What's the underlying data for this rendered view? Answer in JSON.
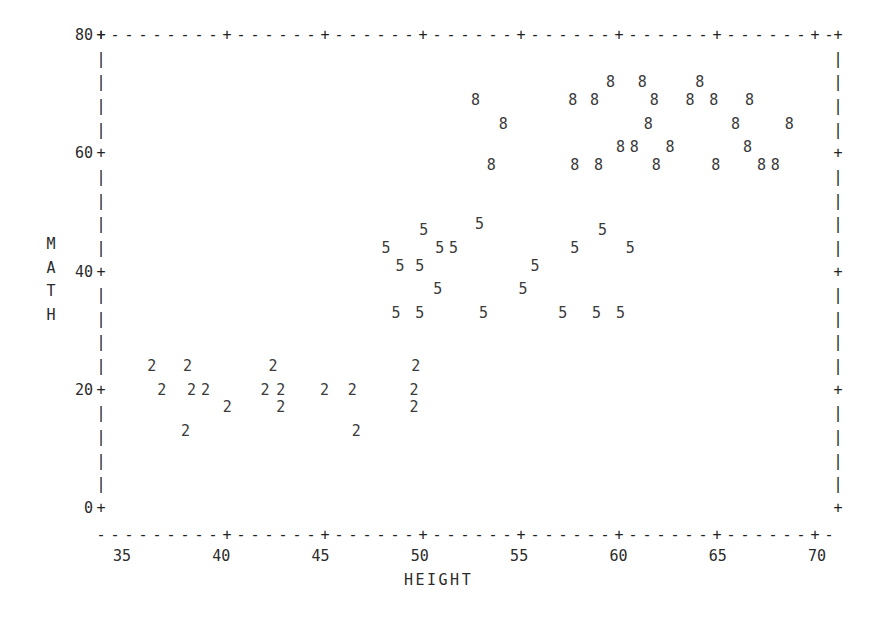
{
  "plot": {
    "type": "text-mode-scatter",
    "xlabel": "HEIGHT",
    "ylabel": "MATH",
    "ylabel_chars": [
      "M",
      "A",
      "T",
      "H"
    ],
    "y_ticks": [
      "80",
      "60",
      "40",
      "20",
      "0"
    ],
    "x_ticks": [
      "35",
      "40",
      "45",
      "50",
      "55",
      "60",
      "65",
      "70"
    ],
    "axis_tick_glyph": "+",
    "axis_horizontal_glyph": "-",
    "axis_vertical_glyph": "|",
    "ink_color": "#2b2b2b",
    "background_color": "#ffffff"
  },
  "chart_data": {
    "type": "scatter",
    "title": "",
    "xlabel": "HEIGHT",
    "ylabel": "MATH",
    "xlim": [
      34,
      71
    ],
    "ylim": [
      0,
      80
    ],
    "grid": false,
    "legend": "none",
    "marker_is_group_label": true,
    "note": "Each plotted character is the group code (2, 5 or 8) printed at the observation's (HEIGHT, MATH) cell.",
    "series": [
      {
        "name": "2",
        "marker": "2",
        "points": [
          [
            36.5,
            24
          ],
          [
            38.3,
            24
          ],
          [
            42.6,
            24
          ],
          [
            49.8,
            24
          ],
          [
            37.0,
            20
          ],
          [
            38.5,
            20
          ],
          [
            39.2,
            20
          ],
          [
            42.2,
            20
          ],
          [
            43.0,
            20
          ],
          [
            45.2,
            20
          ],
          [
            46.6,
            20
          ],
          [
            49.7,
            20
          ],
          [
            40.3,
            17
          ],
          [
            43.0,
            17
          ],
          [
            49.7,
            17
          ],
          [
            38.2,
            13
          ],
          [
            46.8,
            13
          ]
        ]
      },
      {
        "name": "5",
        "marker": "5",
        "points": [
          [
            50.2,
            47
          ],
          [
            53.0,
            48
          ],
          [
            59.2,
            47
          ],
          [
            48.3,
            44
          ],
          [
            51.0,
            44
          ],
          [
            51.7,
            44
          ],
          [
            57.8,
            44
          ],
          [
            60.6,
            44
          ],
          [
            49.0,
            41
          ],
          [
            50.0,
            41
          ],
          [
            55.8,
            41
          ],
          [
            50.9,
            37
          ],
          [
            55.2,
            37
          ],
          [
            48.8,
            33
          ],
          [
            50.0,
            33
          ],
          [
            53.2,
            33
          ],
          [
            57.2,
            33
          ],
          [
            58.9,
            33
          ],
          [
            60.1,
            33
          ]
        ]
      },
      {
        "name": "8",
        "marker": "8",
        "points": [
          [
            59.6,
            72
          ],
          [
            61.2,
            72
          ],
          [
            64.1,
            72
          ],
          [
            57.7,
            69
          ],
          [
            58.8,
            69
          ],
          [
            61.8,
            69
          ],
          [
            63.6,
            69
          ],
          [
            64.8,
            69
          ],
          [
            66.6,
            69
          ],
          [
            52.8,
            69
          ],
          [
            54.2,
            65
          ],
          [
            61.5,
            65
          ],
          [
            65.9,
            65
          ],
          [
            68.6,
            65
          ],
          [
            60.1,
            61
          ],
          [
            60.8,
            61
          ],
          [
            62.6,
            61
          ],
          [
            66.5,
            61
          ],
          [
            53.6,
            58
          ],
          [
            57.8,
            58
          ],
          [
            59.0,
            58
          ],
          [
            61.9,
            58
          ],
          [
            64.9,
            58
          ],
          [
            67.2,
            58
          ],
          [
            67.9,
            58
          ]
        ]
      }
    ]
  }
}
